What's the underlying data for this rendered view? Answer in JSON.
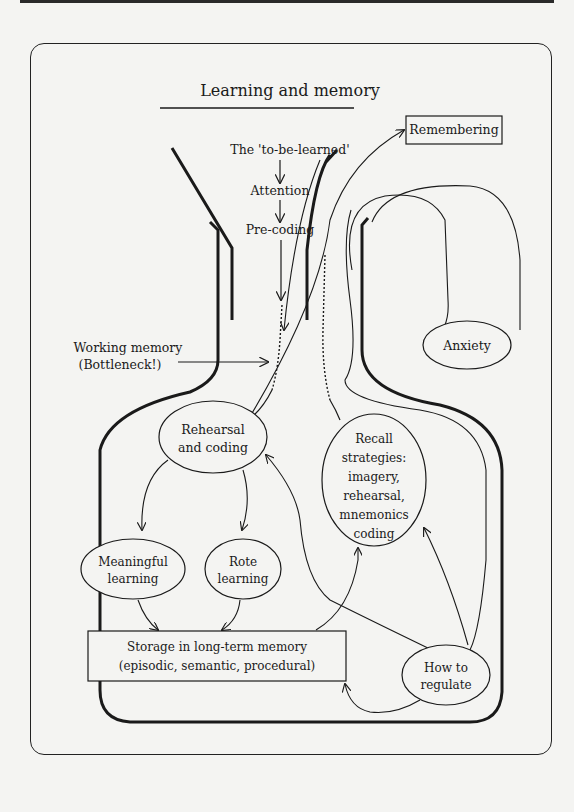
{
  "title": "Learning and memory",
  "flow": {
    "input": "The 'to-be-learned'",
    "attention": "Attention",
    "precoding": "Pre-coding",
    "working_memory_line1": "Working memory",
    "working_memory_line2": "(Bottleneck!)"
  },
  "boxes": {
    "remembering": "Remembering",
    "storage_line1": "Storage in long-term memory",
    "storage_line2": "(episodic, semantic, procedural)"
  },
  "nodes": {
    "rehearsal_line1": "Rehearsal",
    "rehearsal_line2": "and coding",
    "recall_lines": [
      "Recall",
      "strategies:",
      "imagery,",
      "rehearsal,",
      "mnemonics",
      "coding"
    ],
    "meaningful_line1": "Meaningful",
    "meaningful_line2": "learning",
    "rote_line1": "Rote",
    "rote_line2": "learning",
    "anxiety": "Anxiety",
    "regulate_line1": "How to",
    "regulate_line2": "regulate"
  },
  "colors": {
    "ink": "#1a1a1a",
    "paper": "#f4f4f2"
  }
}
